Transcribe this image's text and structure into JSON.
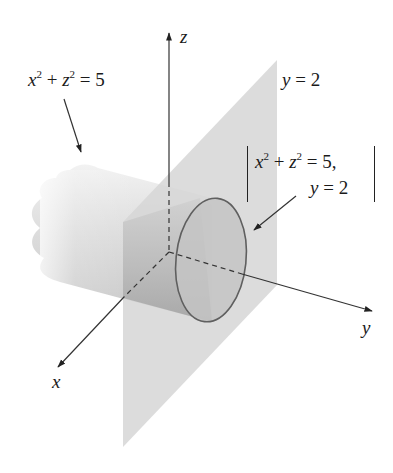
{
  "figure": {
    "type": "3d-surface-intersection",
    "labels": {
      "cylinder_eq": {
        "x": "x",
        "plus": "+",
        "z": "z",
        "exp": "2",
        "rhs": "= 5"
      },
      "plane_eq": {
        "var": "y",
        "rhs": "= 2"
      },
      "system_line1": {
        "x": "x",
        "plus": "+",
        "z": "z",
        "exp": "2",
        "rhs": "= 5,"
      },
      "system_line2": {
        "var": "y",
        "rhs": "= 2"
      },
      "axis_x": "x",
      "axis_y": "y",
      "axis_z": "z"
    },
    "colors": {
      "plane": "#d9d9d9",
      "cylinder_light": "#f0f0f0",
      "cylinder_dark": "#a8a8a8",
      "circle_fill": "#bdbdbd",
      "circle_stroke": "#666666",
      "axis": "#333333"
    }
  }
}
